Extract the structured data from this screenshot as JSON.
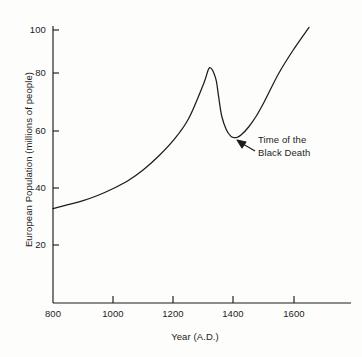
{
  "chart_data": {
    "type": "line",
    "title": "",
    "xlabel": "Year (A.D.)",
    "ylabel": "European Population (millions of people)",
    "xlim": [
      800,
      1700
    ],
    "ylim": [
      0,
      105
    ],
    "xticks": [
      800,
      1000,
      1200,
      1400,
      1600
    ],
    "yticks": [
      20,
      40,
      60,
      80,
      100
    ],
    "xtick_labels": [
      "800",
      "1000",
      "1200",
      "1400",
      "1600"
    ],
    "ytick_labels": [
      "20",
      "40",
      "60",
      "80",
      "100"
    ],
    "grid": false,
    "legend": null,
    "series": [
      {
        "name": "European population",
        "x": [
          800,
          850,
          900,
          950,
          1000,
          1050,
          1100,
          1150,
          1200,
          1250,
          1300,
          1320,
          1340,
          1350,
          1360,
          1375,
          1390,
          1400,
          1410,
          1425,
          1450,
          1475,
          1500,
          1550,
          1600,
          1650
        ],
        "values": [
          33.5,
          35,
          36.5,
          38.5,
          41,
          44,
          48,
          53,
          59,
          67,
          80,
          86,
          82,
          75,
          68,
          63,
          60.5,
          60,
          60,
          61,
          64,
          68,
          73,
          84,
          93,
          101
        ]
      }
    ],
    "annotations": [
      {
        "name": "black-death-annotation",
        "text_line1": "Time of the",
        "text_line2": "Black Death",
        "points_to_year": 1400,
        "points_to_value": 60
      }
    ],
    "line_color": "#1c1c1c",
    "axis_color": "#1c1c1c",
    "background_color": "#fdfdfc"
  }
}
